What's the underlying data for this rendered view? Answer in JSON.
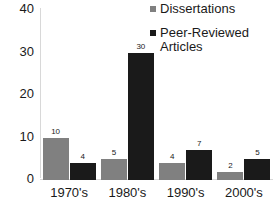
{
  "chart_data": {
    "type": "bar",
    "title": "",
    "xlabel": "",
    "ylabel": "",
    "categories": [
      "1970's",
      "1980's",
      "1990's",
      "2000's"
    ],
    "series": [
      {
        "name": "Dissertations",
        "color": "#808080",
        "values": [
          10,
          5,
          4,
          2
        ]
      },
      {
        "name": "Peer-Reviewed Articles",
        "color": "#1a1a1a",
        "values": [
          4,
          30,
          7,
          5
        ]
      }
    ],
    "yticks": [
      0,
      10,
      20,
      30,
      40
    ],
    "ylim": [
      0,
      40
    ],
    "grid": false,
    "legend_position": "top-right",
    "data_labels": true
  },
  "legend": {
    "entries": [
      {
        "label": "Dissertations"
      },
      {
        "label": "Peer-Reviewed\nArticles"
      }
    ]
  }
}
